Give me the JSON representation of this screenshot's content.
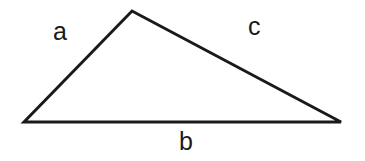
{
  "figure": {
    "name": "triangle-with-labeled-sides",
    "background_color": "#ffffff",
    "stroke_color": "#1a1a1a",
    "text_color": "#1a1a1a",
    "width": 365,
    "height": 161
  },
  "chart_data": {
    "type": "diagram",
    "shape": "triangle",
    "title": "",
    "vertices": [
      {
        "name": "left-vertex",
        "x": 24,
        "y": 122
      },
      {
        "name": "apex-vertex",
        "x": 132,
        "y": 11
      },
      {
        "name": "right-vertex",
        "x": 341,
        "y": 122
      }
    ],
    "sides": [
      {
        "label": "a",
        "from": "left-vertex",
        "to": "apex-vertex",
        "label_position": {
          "x": 53,
          "y": 19
        }
      },
      {
        "label": "c",
        "from": "apex-vertex",
        "to": "right-vertex",
        "label_position": {
          "x": 248,
          "y": 14
        }
      },
      {
        "label": "b",
        "from": "left-vertex",
        "to": "right-vertex",
        "label_position": {
          "x": 179,
          "y": 129
        }
      }
    ],
    "stroke_width": 3,
    "grid": false,
    "legend": false,
    "xlabel": "",
    "ylabel": ""
  },
  "labels": {
    "side_a": "a",
    "side_b": "b",
    "side_c": "c"
  }
}
